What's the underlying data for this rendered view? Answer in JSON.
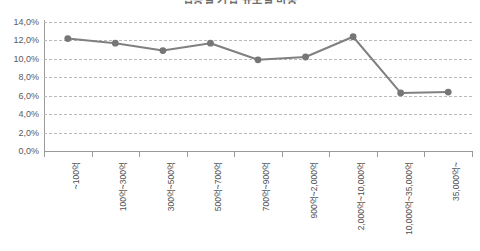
{
  "chart_data": {
    "type": "line",
    "title": "업종별 기업 규모별 비중",
    "categories": [
      "~100억",
      "100억~300억",
      "300억~500억",
      "500억~700억",
      "700억~900억",
      "900억~2,000억",
      "2,000억~10,000억",
      "10,000억~35,000억",
      "35,000억~"
    ],
    "values": [
      12.2,
      11.7,
      10.9,
      11.7,
      9.9,
      10.2,
      12.4,
      6.3,
      6.4
    ],
    "value_labels": [
      "12,2%",
      "11,7%",
      "10,9%",
      "11,7%",
      "9,9%",
      "10,2%",
      "12,4%",
      "6,3%",
      "6,4%"
    ],
    "xlabel": "",
    "ylabel": "",
    "ylim": [
      0,
      14
    ],
    "ytick_values": [
      0,
      2,
      4,
      6,
      8,
      10,
      12,
      14
    ],
    "ytick_labels": [
      "0,0%",
      "2,0%",
      "4,0%",
      "6,0%",
      "8,0%",
      "10,0%",
      "12,0%",
      "14,0%"
    ],
    "grid": true,
    "grid_style": "dashed-horizontal",
    "legend": false,
    "legend_position": "none",
    "series_color": "#808080",
    "marker_color": "#767676",
    "marker_shape": "circle",
    "gridline_color": "#b9b9b9",
    "axis_color": "#9a9a9a",
    "text_color": "#5a5a5a"
  }
}
